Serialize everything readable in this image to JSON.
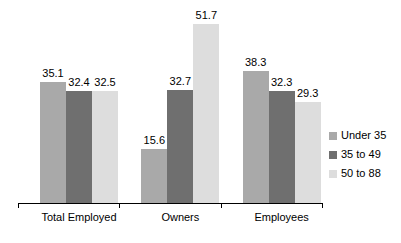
{
  "chart_data": {
    "type": "bar",
    "title": "",
    "subtitle": "",
    "xlabel": "",
    "ylabel": "",
    "categories": [
      "Total Employed",
      "Owners",
      "Employees"
    ],
    "series": [
      {
        "name": "Under 35",
        "color": "#a9a9a9",
        "values": [
          35.1,
          15.6,
          38.3
        ]
      },
      {
        "name": "35 to 49",
        "color": "#6f6f6f",
        "values": [
          32.4,
          32.7,
          32.3
        ]
      },
      {
        "name": "50 to 88",
        "color": "#dddddd",
        "values": [
          29.3,
          51.7,
          29.3
        ]
      }
    ],
    "values_by_group": [
      {
        "category": "Total Employed",
        "values": [
          35.1,
          32.4,
          32.5
        ]
      },
      {
        "category": "Owners",
        "values": [
          15.6,
          32.7,
          51.7
        ]
      },
      {
        "category": "Employees",
        "values": [
          38.3,
          32.3,
          29.3
        ]
      }
    ],
    "data_labels": [
      "35.1",
      "32.4",
      "32.5",
      "15.6",
      "32.7",
      "51.7",
      "38.3",
      "32.3",
      "29.3"
    ],
    "ylim": [
      0,
      57
    ],
    "grid": false,
    "legend_position": "right",
    "axis_line": true
  },
  "legend": {
    "items": [
      {
        "label": "Under 35",
        "color": "#a9a9a9"
      },
      {
        "label": "35 to 49",
        "color": "#6f6f6f"
      },
      {
        "label": "50 to 88",
        "color": "#dddddd"
      }
    ]
  },
  "axis": {
    "categories": [
      "Total Employed",
      "Owners",
      "Employees"
    ]
  }
}
